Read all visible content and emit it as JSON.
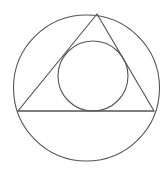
{
  "diagram": {
    "line_color": "#555555",
    "background_color": "#ffffff",
    "shapes": [
      {
        "id": "outer-circle",
        "type": "circle",
        "role": "circumscribed circle"
      },
      {
        "id": "triangle",
        "type": "triangle",
        "role": "inscribed triangle"
      },
      {
        "id": "inner-circle",
        "type": "circle",
        "role": "incircle of triangle"
      }
    ]
  }
}
